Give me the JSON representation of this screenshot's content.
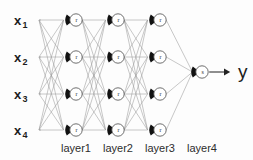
{
  "diagram": {
    "background_color": "#fdfdfd",
    "edge_color": "#9a9a9a",
    "node_fill": "#ffffff",
    "node_stroke": "#4a4a4a",
    "node_cap_color": "#111111",
    "text_color": "#1d1d1d",
    "inputs": [
      {
        "base": "x",
        "sub": "1",
        "y": 20
      },
      {
        "base": "x",
        "sub": "2",
        "y": 57
      },
      {
        "base": "x",
        "sub": "3",
        "y": 94
      },
      {
        "base": "x",
        "sub": "4",
        "y": 130
      }
    ],
    "hidden_layers": [
      {
        "label": "layer1",
        "x": 76,
        "letter": "r",
        "node_count": 4
      },
      {
        "label": "layer2",
        "x": 118,
        "letter": "r",
        "node_count": 4
      },
      {
        "label": "layer3",
        "x": 160,
        "letter": "r",
        "node_count": 4
      }
    ],
    "output_layer": {
      "label": "layer4",
      "x": 202,
      "y": 72,
      "letter": "s",
      "node_count": 1
    },
    "rows_y": [
      20,
      57,
      94,
      130
    ],
    "layer_label_y": 152,
    "output": {
      "label": "y",
      "x": 238,
      "y": 78
    },
    "activation_legend": {
      "hidden_letter": "r",
      "output_letter": "s"
    }
  }
}
